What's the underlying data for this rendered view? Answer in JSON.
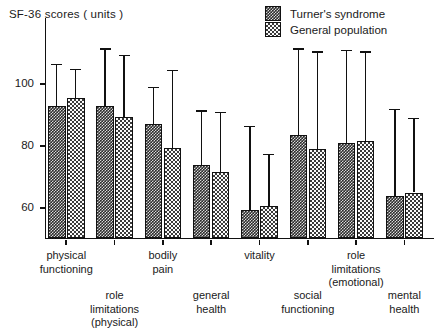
{
  "chart_data": {
    "type": "bar",
    "title": "SF-36 scores ( units )",
    "xlabel": "",
    "ylabel": "SF-36 scores ( units )",
    "ylim": [
      48,
      120
    ],
    "yticks": [
      60,
      80,
      100
    ],
    "ytick_labels": [
      "60",
      "80",
      "100"
    ],
    "grid": false,
    "legend_position": "top-right",
    "orientation": "vertical",
    "categories": [
      "physical functioning",
      "role limitations (physical)",
      "bodily pain",
      "general health",
      "vitality",
      "social functioning",
      "role limitations (emotional)",
      "mental health"
    ],
    "series": [
      {
        "name": "Turner's syndrome",
        "pattern": "dense-dark-hatch",
        "values": [
          93,
          93,
          87,
          74,
          59.5,
          83.5,
          81,
          64
        ],
        "error_high": [
          106.5,
          111.5,
          99,
          91.5,
          86.5,
          111.5,
          111,
          92
        ]
      },
      {
        "name": "General population",
        "pattern": "light-dotted",
        "values": [
          95.5,
          89.5,
          79.5,
          71.5,
          60.5,
          79,
          81.5,
          65
        ],
        "error_high": [
          105,
          109.5,
          104.5,
          91,
          77.5,
          110.5,
          110.5,
          89
        ]
      }
    ]
  },
  "legend": {
    "items": [
      {
        "label": "Turner's syndrome"
      },
      {
        "label": "General population"
      }
    ]
  },
  "category_labels": [
    {
      "lines": [
        "physical",
        "functioning"
      ],
      "row": "upper"
    },
    {
      "lines": [
        "role",
        "limitations",
        "(physical)"
      ],
      "row": "lower"
    },
    {
      "lines": [
        "bodily",
        "pain"
      ],
      "row": "upper"
    },
    {
      "lines": [
        "general",
        "health"
      ],
      "row": "lower"
    },
    {
      "lines": [
        "vitality"
      ],
      "row": "upper"
    },
    {
      "lines": [
        "social",
        "functioning"
      ],
      "row": "lower"
    },
    {
      "lines": [
        "role",
        "limitations",
        "(emotional)"
      ],
      "row": "upper"
    },
    {
      "lines": [
        "mental",
        "health"
      ],
      "row": "lower"
    }
  ]
}
